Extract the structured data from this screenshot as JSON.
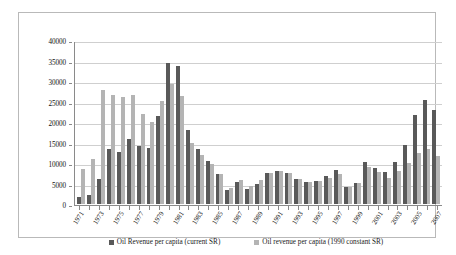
{
  "chart_data": {
    "type": "bar",
    "title": "",
    "subtitle": "",
    "xlabel": "",
    "ylabel": "",
    "ylim": [
      0,
      40000
    ],
    "ytick_step": 5000,
    "yticks": [
      "0",
      "5000",
      "10000",
      "15000",
      "20000",
      "25000",
      "30000",
      "35000",
      "40000"
    ],
    "grid": true,
    "legend_position": "bottom",
    "categories": [
      "1971",
      "1972",
      "1973",
      "1974",
      "1975",
      "1976",
      "1977",
      "1978",
      "1979",
      "1980",
      "1981",
      "1982",
      "1983",
      "1984",
      "1985",
      "1986",
      "1987",
      "1988",
      "1989",
      "1990",
      "1991",
      "1992",
      "1993",
      "1994",
      "1995",
      "1996",
      "1997",
      "1998",
      "1999",
      "2000",
      "2001",
      "2002",
      "2003",
      "2004",
      "2005",
      "2006",
      "2007"
    ],
    "xtick_labels_shown": [
      "1971",
      "",
      "1973",
      "",
      "1975",
      "",
      "1977",
      "",
      "1979",
      "",
      "1981",
      "",
      "1983",
      "",
      "1985",
      "",
      "1987",
      "",
      "1989",
      "",
      "1991",
      "",
      "1993",
      "",
      "1995",
      "",
      "1997",
      "",
      "1999",
      "",
      "2001",
      "",
      "2003",
      "",
      "2005",
      "",
      "2007"
    ],
    "series": [
      {
        "name": "Oil Revenue per capita (current SR)",
        "color": "#595959",
        "values": [
          1700,
          2200,
          6100,
          13400,
          12700,
          15800,
          14100,
          13600,
          21500,
          34300,
          33600,
          18000,
          13300,
          10500,
          7300,
          3500,
          5400,
          3600,
          5000,
          7600,
          8000,
          7500,
          6100,
          5300,
          5500,
          6900,
          8400,
          4100,
          5200,
          10200,
          8700,
          7700,
          10200,
          14500,
          21700,
          25400,
          23000
        ]
      },
      {
        "name": "Oil revenue per capita (1990 constant SR)",
        "color": "#b4b4b4",
        "values": [
          8500,
          11100,
          27900,
          26700,
          26100,
          26500,
          21900,
          19900,
          25200,
          29300,
          26300,
          15000,
          11900,
          9700,
          7400,
          4000,
          5900,
          4300,
          5900,
          7600,
          8100,
          7500,
          6100,
          5400,
          5700,
          6400,
          7300,
          4100,
          5200,
          9000,
          7900,
          6300,
          8000,
          10000,
          12500,
          13400,
          11700
        ]
      }
    ]
  },
  "legend": {
    "items": [
      {
        "label": "Oil Revenue per capita (current SR)",
        "color": "#595959"
      },
      {
        "label": "Oil revenue per capita (1990 constant SR)",
        "color": "#b4b4b4"
      }
    ]
  },
  "colors": {
    "series_current": "#595959",
    "series_constant": "#b4b4b4",
    "gridline": "#cfcfcf",
    "axis": "#8a8a8a",
    "frame": "#b9b9b9",
    "background": "#ffffff"
  }
}
